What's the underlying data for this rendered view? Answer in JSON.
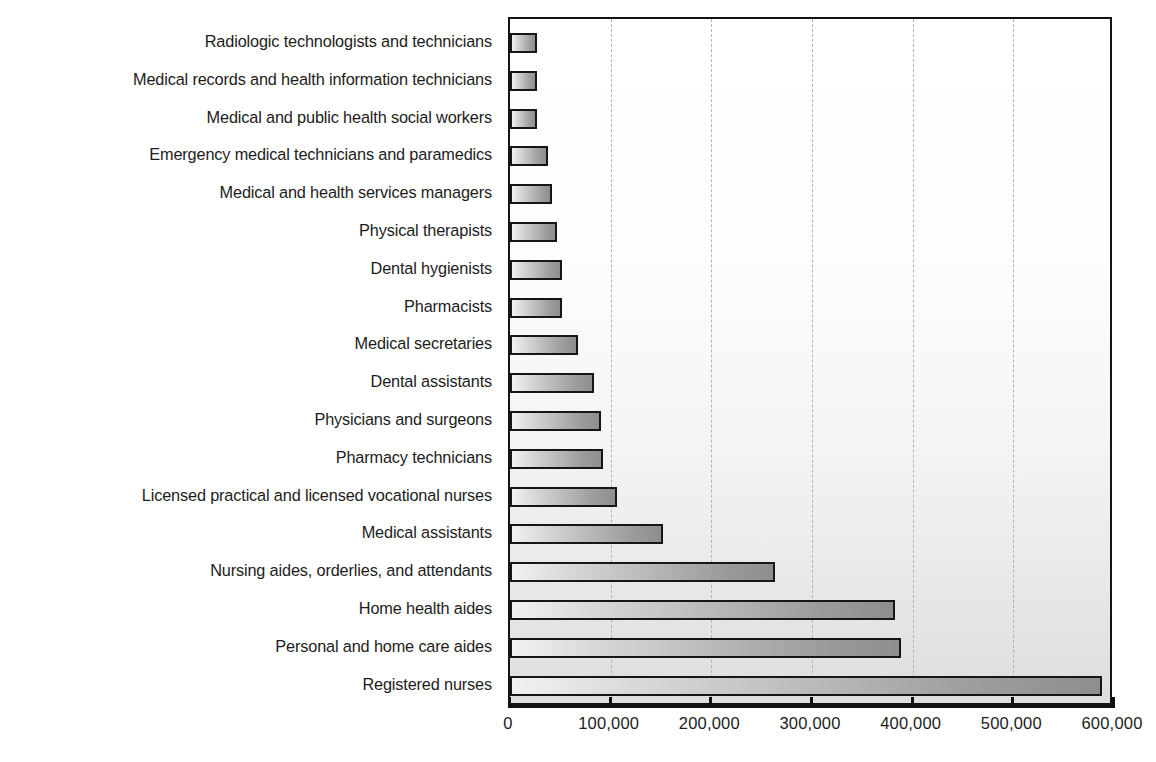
{
  "chart_data": {
    "type": "bar",
    "orientation": "horizontal",
    "title": "",
    "subtitle": "",
    "xlabel": "",
    "ylabel": "",
    "xlim": [
      0,
      600000
    ],
    "ylim": null,
    "grid": true,
    "grid_axis": "x",
    "legend": null,
    "legend_position": "none",
    "xticks": [
      0,
      100000,
      200000,
      300000,
      400000,
      500000,
      600000
    ],
    "xtick_labels": [
      "0",
      "100,000",
      "200,000",
      "300,000",
      "400,000",
      "500,000",
      "600,000"
    ],
    "categories": [
      "Radiologic technologists and technicians",
      "Medical records and health information technicians",
      "Medical and public health social workers",
      "Emergency medical technicians and paramedics",
      "Medical and health services managers",
      "Physical therapists",
      "Dental hygienists",
      "Pharmacists",
      "Medical secretaries",
      "Dental assistants",
      "Physicians and surgeons",
      "Pharmacy technicians",
      "Licensed practical and licensed vocational nurses",
      "Medical assistants",
      "Nursing aides, orderlies, and attendants",
      "Home health aides",
      "Personal and home care aides",
      "Registered nurses"
    ],
    "values": [
      27000,
      27000,
      27000,
      38000,
      42000,
      47000,
      52000,
      52000,
      68000,
      83000,
      90000,
      92000,
      106000,
      152000,
      263000,
      382000,
      388000,
      588000
    ],
    "colors": {
      "bar_fill_light": "#f2f2f2",
      "bar_fill_dark": "#8e8e8e",
      "bar_border": "#161616",
      "gridline": "#b4b4b4",
      "axis": "#121212",
      "text": "#1c1c1c",
      "plot_background_top": "#ffffff",
      "plot_background_bottom": "#dedede"
    }
  }
}
